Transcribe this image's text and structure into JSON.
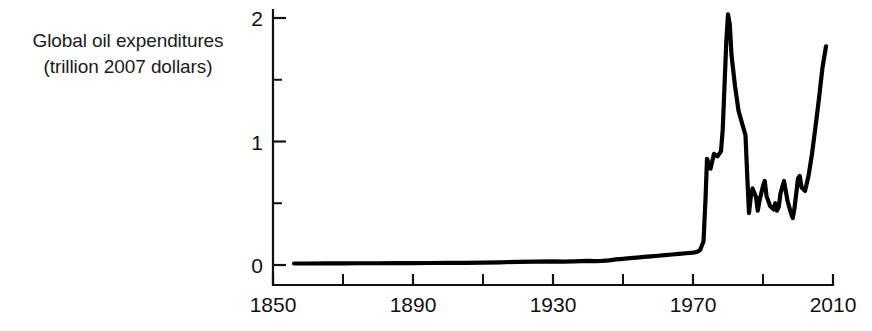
{
  "axis_label": {
    "line1": "Global oil expenditures",
    "line2": "(trillion 2007 dollars)"
  },
  "ticks": {
    "y": [
      "0",
      "1",
      "2"
    ],
    "x": [
      "1850",
      "1890",
      "1930",
      "1970",
      "2010"
    ]
  },
  "style": {
    "line_color": "#000000",
    "axis_color": "#111111",
    "background": "#ffffff"
  },
  "chart_data": {
    "type": "line",
    "title": "",
    "xlabel": "",
    "ylabel": "Global oil expenditures (trillion 2007 dollars)",
    "xlim": [
      1850,
      2010
    ],
    "ylim": [
      0,
      2.08
    ],
    "grid": false,
    "legend": null,
    "x_major_ticks": [
      1850,
      1890,
      1930,
      1970,
      2010
    ],
    "x_minor_ticks": [
      1870,
      1910,
      1950,
      1990
    ],
    "y_major_ticks": [
      0,
      1,
      2
    ],
    "y_minor_ticks": [
      0.5,
      1.5
    ],
    "units": "trillion 2007 dollars",
    "series": [
      {
        "name": "Global oil expenditures",
        "x": [
          1856,
          1860,
          1865,
          1870,
          1875,
          1880,
          1885,
          1890,
          1895,
          1900,
          1905,
          1910,
          1915,
          1920,
          1925,
          1930,
          1933,
          1936,
          1938,
          1940,
          1942,
          1944,
          1946,
          1948,
          1950,
          1952,
          1954,
          1956,
          1958,
          1960,
          1962,
          1964,
          1966,
          1968,
          1970,
          1971,
          1972,
          1973,
          1973.6,
          1974,
          1974.5,
          1975,
          1975.5,
          1976,
          1977,
          1978,
          1978.5,
          1979,
          1979.5,
          1980,
          1980.5,
          1981,
          1982,
          1983,
          1984,
          1985,
          1985.5,
          1986,
          1986.5,
          1987,
          1988,
          1988.5,
          1989,
          1990,
          1990.5,
          1991,
          1992,
          1993,
          1993.5,
          1994,
          1994.5,
          1995,
          1996,
          1996.5,
          1997,
          1998,
          1998.5,
          1999,
          2000,
          2000.5,
          2001,
          2002,
          2003,
          2004,
          2005,
          2006,
          2007,
          2008
        ],
        "y": [
          0.012,
          0.012,
          0.013,
          0.013,
          0.014,
          0.014,
          0.015,
          0.015,
          0.016,
          0.017,
          0.018,
          0.02,
          0.022,
          0.026,
          0.028,
          0.03,
          0.027,
          0.029,
          0.031,
          0.033,
          0.032,
          0.034,
          0.038,
          0.045,
          0.05,
          0.055,
          0.06,
          0.066,
          0.07,
          0.075,
          0.08,
          0.085,
          0.09,
          0.095,
          0.1,
          0.105,
          0.12,
          0.19,
          0.55,
          0.86,
          0.82,
          0.78,
          0.84,
          0.9,
          0.88,
          0.92,
          1.1,
          1.45,
          1.8,
          2.03,
          1.95,
          1.7,
          1.45,
          1.25,
          1.15,
          1.05,
          0.72,
          0.42,
          0.55,
          0.62,
          0.55,
          0.44,
          0.52,
          0.64,
          0.68,
          0.56,
          0.48,
          0.45,
          0.5,
          0.44,
          0.47,
          0.58,
          0.68,
          0.6,
          0.52,
          0.42,
          0.38,
          0.46,
          0.7,
          0.72,
          0.63,
          0.6,
          0.72,
          0.9,
          1.12,
          1.35,
          1.6,
          1.77
        ]
      }
    ]
  }
}
